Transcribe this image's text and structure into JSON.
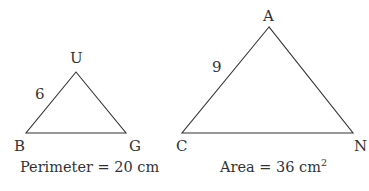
{
  "figures": [
    {
      "id": "triangle-BUG",
      "vertices": {
        "U": {
          "label": "U"
        },
        "B": {
          "label": "B"
        },
        "G": {
          "label": "G"
        }
      },
      "side_label": "6",
      "side_labeled": "BU",
      "caption": "Perimeter = 20 cm"
    },
    {
      "id": "triangle-CAN",
      "vertices": {
        "A": {
          "label": "A"
        },
        "C": {
          "label": "C"
        },
        "N": {
          "label": "N"
        }
      },
      "side_label": "9",
      "side_labeled": "CA",
      "caption_main": "Area = 36 cm",
      "caption_sup": "2"
    }
  ],
  "colors": {
    "stroke": "#333333",
    "text": "#333333",
    "background": "#ffffff"
  }
}
